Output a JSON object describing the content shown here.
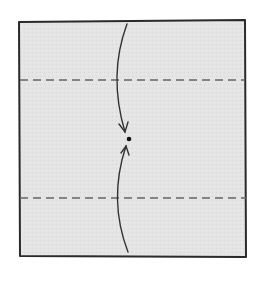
{
  "diagram": {
    "type": "origami-fold-step",
    "paper": {
      "fill": "#e6e6e6",
      "stroke": "#2a2a2a"
    },
    "valley_folds": [
      {
        "name": "top-fold-line",
        "y": 80
      },
      {
        "name": "bottom-fold-line",
        "y": 198
      }
    ],
    "arrows": [
      {
        "name": "fold-down-arrow",
        "direction": "down"
      },
      {
        "name": "fold-up-arrow",
        "direction": "up"
      }
    ],
    "target_point": {
      "x": 129,
      "y": 139
    }
  }
}
